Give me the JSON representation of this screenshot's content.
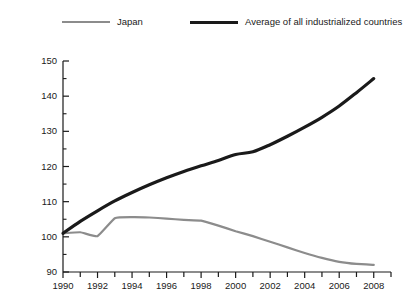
{
  "chart_data": {
    "type": "line",
    "title": "",
    "subtitle": "",
    "xlabel": "",
    "ylabel": "",
    "xlim": [
      1990,
      2009
    ],
    "ylim": [
      90,
      150
    ],
    "ytick_values": [
      90,
      100,
      110,
      120,
      130,
      140,
      150
    ],
    "ytick_labels": [
      "90",
      "100",
      "110",
      "120",
      "130",
      "140",
      "150"
    ],
    "yminor_step": 5,
    "xtick_values": [
      1990,
      1992,
      1994,
      1996,
      1998,
      2000,
      2002,
      2004,
      2006,
      2008
    ],
    "xtick_labels": [
      "1990",
      "1992",
      "1994",
      "1996",
      "1998",
      "2000",
      "2002",
      "2004",
      "2006",
      "2008"
    ],
    "xminor_step": 1,
    "grid": false,
    "legend_position": "top",
    "x": [
      1990,
      1991,
      1992,
      1993,
      1994,
      1995,
      1996,
      1997,
      1998,
      1999,
      2000,
      2001,
      2002,
      2003,
      2004,
      2005,
      2006,
      2007,
      2008
    ],
    "series": [
      {
        "name": "Japan",
        "color": "#8c8c8c",
        "width": 2.2,
        "values": [
          101.0,
          101.3,
          100.2,
          105.3,
          105.6,
          105.5,
          105.2,
          104.8,
          104.6,
          103.2,
          101.6,
          100.2,
          98.6,
          97.0,
          95.4,
          94.0,
          92.9,
          92.3,
          92.0
        ]
      },
      {
        "name": "Average of all industrialized countries",
        "color": "#1a1a1a",
        "width": 3.2,
        "values": [
          101.0,
          104.4,
          107.4,
          110.2,
          112.6,
          114.8,
          116.8,
          118.6,
          120.2,
          121.7,
          123.4,
          124.2,
          126.2,
          128.6,
          131.2,
          134.0,
          137.2,
          141.0,
          145.0
        ]
      }
    ]
  },
  "legend": {
    "entries": [
      {
        "label": "Japan",
        "swatch": "gray-line-swatch"
      },
      {
        "label": "Average of all industrialized countries",
        "swatch": "black-line-swatch"
      }
    ]
  },
  "axes": {
    "y_labels": [
      "150",
      "140",
      "130",
      "120",
      "110",
      "100",
      "90"
    ],
    "x_labels": [
      "1990",
      "1992",
      "1994",
      "1996",
      "1998",
      "2000",
      "2002",
      "2004",
      "2006",
      "2008"
    ]
  },
  "colors": {
    "japan_line": "#8c8c8c",
    "average_line": "#1a1a1a",
    "axis": "#1a1a1a",
    "background": "#ffffff"
  }
}
